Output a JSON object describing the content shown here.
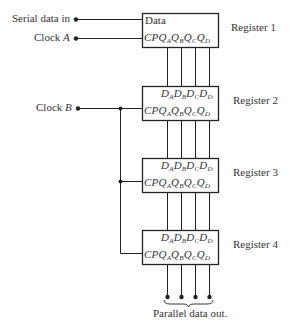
{
  "inputs": {
    "serial_data_in": "Serial data in",
    "clock_a_prefix": "Clock ",
    "clock_a_var": "A",
    "clock_b_prefix": "Clock ",
    "clock_b_var": "B"
  },
  "registers": [
    {
      "name": "Register 1",
      "top_label": "Data",
      "bottom_pins": [
        "CP",
        "Q",
        "A",
        "Q",
        "B",
        "Q",
        "C",
        "Q",
        "D"
      ]
    },
    {
      "name": "Register 2",
      "top_pins": [
        "D",
        "A",
        "D",
        "B",
        "D",
        "C",
        "D",
        "D"
      ],
      "bottom_pins": [
        "CP",
        "Q",
        "A",
        "Q",
        "B",
        "Q",
        "C",
        "Q",
        "D"
      ]
    },
    {
      "name": "Register 3",
      "top_pins": [
        "D",
        "A",
        "D",
        "B",
        "D",
        "C",
        "D",
        "D"
      ],
      "bottom_pins": [
        "CP",
        "Q",
        "A",
        "Q",
        "B",
        "Q",
        "C",
        "Q",
        "D"
      ]
    },
    {
      "name": "Register 4",
      "top_pins": [
        "D",
        "A",
        "D",
        "B",
        "D",
        "C",
        "D",
        "D"
      ],
      "bottom_pins": [
        "CP",
        "Q",
        "A",
        "Q",
        "B",
        "Q",
        "C",
        "Q",
        "D"
      ]
    }
  ],
  "output": {
    "label": "Parallel data out."
  },
  "colors": {
    "line": "#222222",
    "background": "#ffffff"
  }
}
